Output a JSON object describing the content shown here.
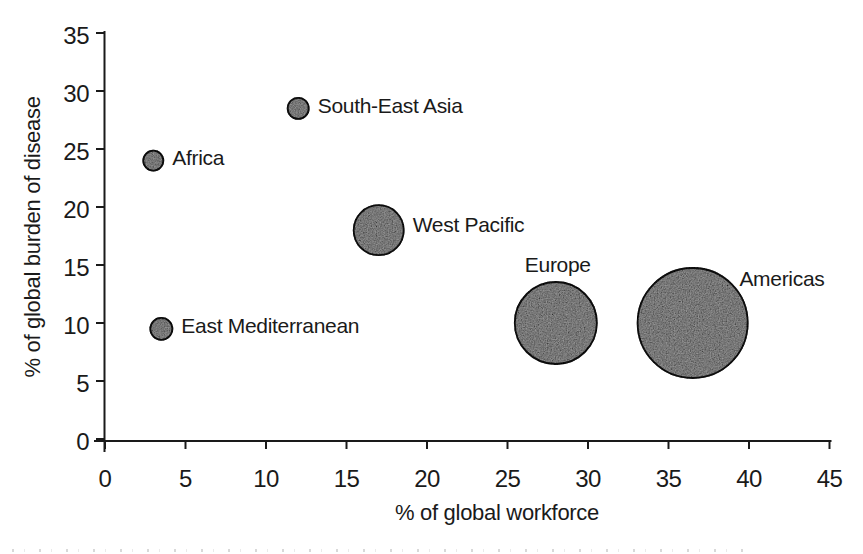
{
  "chart_data": {
    "type": "scatter",
    "subtype": "bubble",
    "title": "",
    "xlabel": "% of global workforce",
    "ylabel": "% of global burden of disease",
    "xlim": [
      0,
      45
    ],
    "ylim": [
      0,
      35
    ],
    "xticks": [
      0,
      5,
      10,
      15,
      20,
      25,
      30,
      35,
      40,
      45
    ],
    "yticks": [
      0,
      5,
      10,
      15,
      20,
      25,
      30,
      35
    ],
    "grid": false,
    "legend": "none",
    "points": [
      {
        "label": "South-East Asia",
        "x": 12,
        "y": 28.5,
        "radius_px": 10.5,
        "label_pos": "right"
      },
      {
        "label": "Africa",
        "x": 3,
        "y": 24,
        "radius_px": 10,
        "label_pos": "right"
      },
      {
        "label": "West Pacific",
        "x": 17,
        "y": 18,
        "radius_px": 25,
        "label_pos": "right"
      },
      {
        "label": "East Mediterranean",
        "x": 3.5,
        "y": 9.5,
        "radius_px": 11,
        "label_pos": "right"
      },
      {
        "label": "Europe",
        "x": 28,
        "y": 10,
        "radius_px": 41,
        "label_pos": "above"
      },
      {
        "label": "Americas",
        "x": 36.5,
        "y": 10,
        "radius_px": 55,
        "label_pos": "right-top"
      }
    ],
    "colors": {
      "bubble_fill": "#a8a8a8",
      "bubble_stroke": "#1b1b1b",
      "axis": "#1a1a1a",
      "text": "#1a1a1a"
    }
  }
}
